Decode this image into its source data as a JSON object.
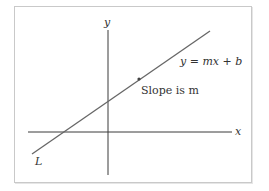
{
  "diagram": {
    "axes": {
      "x_label": "x",
      "y_label": "y"
    },
    "line": {
      "name_label": "L",
      "equation_label": "y = mx + b",
      "slope_label": "Slope is m"
    },
    "colors": {
      "line": "#666666",
      "axes": "#3a3a3a",
      "frame": "#c9c9c9",
      "text": "#333333"
    }
  }
}
